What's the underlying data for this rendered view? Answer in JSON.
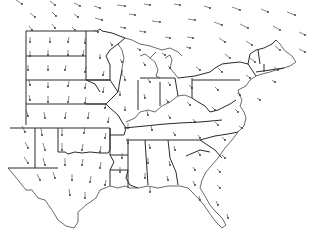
{
  "map": {
    "type": "wind-vector-field",
    "region": "Central and Eastern United States",
    "background": "#ffffff",
    "line_color": "#2a2a2a",
    "arrow_color": "#555555",
    "labels": []
  },
  "arrows": [
    [
      22,
      4,
      -6,
      -4
    ],
    [
      55,
      5,
      -5,
      -4
    ],
    [
      80,
      6,
      -6,
      -3
    ],
    [
      100,
      8,
      -6,
      -2
    ],
    [
      125,
      6,
      -8,
      -1
    ],
    [
      150,
      5,
      -6,
      -1
    ],
    [
      180,
      5,
      -6,
      -1
    ],
    [
      210,
      8,
      -6,
      -2
    ],
    [
      240,
      10,
      -8,
      -3
    ],
    [
      268,
      12,
      -7,
      -3
    ],
    [
      295,
      15,
      -8,
      -3
    ],
    [
      35,
      17,
      -5,
      -4
    ],
    [
      56,
      16,
      -4,
      -4
    ],
    [
      78,
      17,
      -4,
      -3
    ],
    [
      102,
      20,
      -7,
      -2
    ],
    [
      135,
      15,
      -6,
      -1
    ],
    [
      160,
      22,
      -8,
      -1
    ],
    [
      195,
      20,
      -7,
      -1
    ],
    [
      222,
      25,
      -8,
      -3
    ],
    [
      248,
      28,
      -8,
      -4
    ],
    [
      280,
      30,
      -7,
      -4
    ],
    [
      305,
      35,
      -6,
      -3
    ],
    [
      32,
      30,
      -3,
      -4
    ],
    [
      55,
      28,
      -3,
      -4
    ],
    [
      75,
      30,
      -3,
      -3
    ],
    [
      98,
      32,
      -4,
      -2
    ],
    [
      125,
      28,
      -5,
      -1
    ],
    [
      145,
      32,
      -6,
      -1
    ],
    [
      170,
      38,
      -5,
      -1
    ],
    [
      193,
      38,
      -6,
      -1
    ],
    [
      225,
      42,
      -6,
      -4
    ],
    [
      252,
      45,
      -6,
      -4
    ],
    [
      280,
      50,
      -5,
      -4
    ],
    [
      305,
      52,
      -6,
      -3
    ],
    [
      30,
      42,
      0,
      -5
    ],
    [
      50,
      42,
      0,
      -5
    ],
    [
      68,
      42,
      1,
      -5
    ],
    [
      85,
      43,
      0,
      -5
    ],
    [
      112,
      45,
      -2,
      -3
    ],
    [
      140,
      50,
      -3,
      -2
    ],
    [
      165,
      55,
      -3,
      -2
    ],
    [
      190,
      48,
      -4,
      -1
    ],
    [
      230,
      58,
      -5,
      -4
    ],
    [
      255,
      62,
      -5,
      -4
    ],
    [
      278,
      70,
      -4,
      -3
    ],
    [
      30,
      56,
      0,
      -5
    ],
    [
      48,
      55,
      0,
      -5
    ],
    [
      68,
      55,
      0,
      -5
    ],
    [
      83,
      55,
      1,
      -5
    ],
    [
      100,
      58,
      0,
      -4
    ],
    [
      122,
      62,
      -2,
      -3
    ],
    [
      145,
      65,
      -2,
      -3
    ],
    [
      170,
      68,
      -2,
      -2
    ],
    [
      200,
      70,
      -4,
      -3
    ],
    [
      222,
      72,
      -4,
      -4
    ],
    [
      250,
      78,
      -4,
      -3
    ],
    [
      275,
      82,
      -3,
      -2
    ],
    [
      28,
      70,
      0,
      -5
    ],
    [
      48,
      70,
      0,
      -5
    ],
    [
      65,
      70,
      1,
      -5
    ],
    [
      85,
      72,
      1,
      -5
    ],
    [
      103,
      75,
      1,
      -4
    ],
    [
      125,
      80,
      -1,
      -4
    ],
    [
      150,
      82,
      -2,
      -3
    ],
    [
      170,
      85,
      -2,
      -3
    ],
    [
      192,
      88,
      -3,
      -3
    ],
    [
      218,
      90,
      -3,
      -3
    ],
    [
      240,
      95,
      -3,
      -2
    ],
    [
      260,
      100,
      -3,
      -2
    ],
    [
      30,
      85,
      -1,
      -5
    ],
    [
      48,
      87,
      0,
      -5
    ],
    [
      68,
      86,
      1,
      -5
    ],
    [
      85,
      88,
      1,
      -5
    ],
    [
      103,
      92,
      1,
      -5
    ],
    [
      120,
      95,
      0,
      -4
    ],
    [
      145,
      98,
      -1,
      -4
    ],
    [
      168,
      102,
      -2,
      -3
    ],
    [
      190,
      105,
      -3,
      -3
    ],
    [
      215,
      110,
      -3,
      -3
    ],
    [
      238,
      112,
      -3,
      -3
    ],
    [
      30,
      100,
      -1,
      -5
    ],
    [
      48,
      102,
      0,
      -6
    ],
    [
      68,
      102,
      1,
      -6
    ],
    [
      85,
      103,
      1,
      -6
    ],
    [
      105,
      108,
      1,
      -5
    ],
    [
      125,
      110,
      0,
      -4
    ],
    [
      148,
      115,
      -1,
      -4
    ],
    [
      170,
      118,
      -2,
      -3
    ],
    [
      195,
      122,
      -2,
      -3
    ],
    [
      218,
      125,
      -3,
      -3
    ],
    [
      242,
      128,
      -3,
      -2
    ],
    [
      28,
      116,
      -2,
      -6
    ],
    [
      45,
      118,
      -1,
      -6
    ],
    [
      65,
      118,
      1,
      -6
    ],
    [
      88,
      118,
      1,
      -6
    ],
    [
      108,
      122,
      1,
      -5
    ],
    [
      128,
      128,
      0,
      -5
    ],
    [
      152,
      130,
      -1,
      -4
    ],
    [
      175,
      135,
      -2,
      -3
    ],
    [
      200,
      138,
      -2,
      -3
    ],
    [
      225,
      140,
      -3,
      -3
    ],
    [
      25,
      132,
      -3,
      -6
    ],
    [
      42,
      135,
      -1,
      -7
    ],
    [
      62,
      135,
      0,
      -7
    ],
    [
      84,
      133,
      1,
      -6
    ],
    [
      105,
      138,
      1,
      -5
    ],
    [
      128,
      143,
      0,
      -5
    ],
    [
      150,
      148,
      -1,
      -4
    ],
    [
      175,
      150,
      -1,
      -4
    ],
    [
      200,
      155,
      -2,
      -3
    ],
    [
      225,
      158,
      -3,
      -3
    ],
    [
      28,
      148,
      -3,
      -6
    ],
    [
      45,
      150,
      -2,
      -7
    ],
    [
      62,
      150,
      0,
      -7
    ],
    [
      82,
      150,
      1,
      -6
    ],
    [
      100,
      152,
      1,
      -6
    ],
    [
      122,
      158,
      0,
      -5
    ],
    [
      148,
      163,
      0,
      -5
    ],
    [
      170,
      165,
      -1,
      -4
    ],
    [
      195,
      170,
      -2,
      -3
    ],
    [
      220,
      172,
      -3,
      -3
    ],
    [
      28,
      163,
      -4,
      -6
    ],
    [
      45,
      165,
      -2,
      -7
    ],
    [
      65,
      165,
      0,
      -7
    ],
    [
      82,
      165,
      1,
      -6
    ],
    [
      100,
      168,
      1,
      -6
    ],
    [
      120,
      172,
      0,
      -5
    ],
    [
      145,
      178,
      0,
      -5
    ],
    [
      168,
      180,
      -1,
      -4
    ],
    [
      195,
      185,
      -2,
      -4
    ],
    [
      220,
      188,
      -3,
      -3
    ],
    [
      40,
      180,
      -3,
      -6
    ],
    [
      55,
      178,
      -2,
      -6
    ],
    [
      72,
      180,
      0,
      -6
    ],
    [
      90,
      182,
      1,
      -6
    ],
    [
      105,
      185,
      1,
      -5
    ],
    [
      150,
      192,
      0,
      -5
    ],
    [
      200,
      200,
      -1,
      -4
    ],
    [
      218,
      205,
      -2,
      -4
    ],
    [
      70,
      195,
      -1,
      -6
    ],
    [
      85,
      198,
      0,
      -6
    ],
    [
      228,
      218,
      -1,
      -4
    ]
  ]
}
